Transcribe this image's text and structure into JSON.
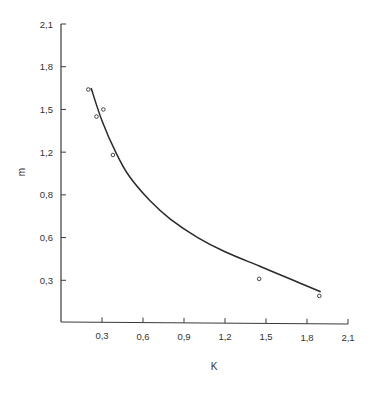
{
  "chart_data": {
    "type": "scatter",
    "title": "",
    "xlabel": "K",
    "ylabel": "m",
    "xlim": [
      0,
      2.1
    ],
    "ylim": [
      0,
      2.1
    ],
    "grid": false,
    "legend": null,
    "x_ticks": [
      {
        "value": 0.3,
        "label": "0,3"
      },
      {
        "value": 0.6,
        "label": "0,6"
      },
      {
        "value": 0.9,
        "label": "0,9"
      },
      {
        "value": 1.2,
        "label": "1,2"
      },
      {
        "value": 1.5,
        "label": "1,5"
      },
      {
        "value": 1.8,
        "label": "1,8"
      },
      {
        "value": 2.1,
        "label": "2,1"
      }
    ],
    "y_ticks": [
      {
        "value": 0.3,
        "label": "0,3"
      },
      {
        "value": 0.6,
        "label": "0,6"
      },
      {
        "value": 0.9,
        "label": "0,8"
      },
      {
        "value": 1.2,
        "label": "1,2"
      },
      {
        "value": 1.5,
        "label": "1,5"
      },
      {
        "value": 1.8,
        "label": "1,8"
      },
      {
        "value": 2.1,
        "label": "2,1"
      }
    ],
    "series": [
      {
        "name": "measured",
        "kind": "points",
        "x": [
          0.2,
          0.26,
          0.31,
          0.38,
          1.45,
          1.89
        ],
        "y": [
          1.64,
          1.45,
          1.5,
          1.18,
          0.31,
          0.19
        ]
      },
      {
        "name": "fit",
        "kind": "curve",
        "x": [
          0.22,
          0.3,
          0.4,
          0.5,
          0.65,
          0.8,
          1.0,
          1.2,
          1.45,
          1.7,
          1.9
        ],
        "y": [
          1.65,
          1.42,
          1.2,
          1.03,
          0.86,
          0.73,
          0.6,
          0.5,
          0.4,
          0.3,
          0.22
        ]
      }
    ]
  }
}
